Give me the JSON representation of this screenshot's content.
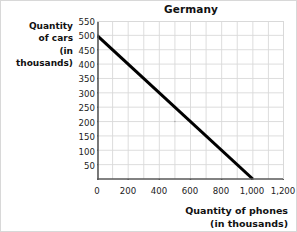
{
  "chart_data": {
    "type": "line",
    "title": "Germany",
    "xlabel_line1": "Quantity of phones",
    "xlabel_line2": "(in thousands)",
    "ylabel_line1": "Quantity",
    "ylabel_line2": "of cars",
    "ylabel_line3": "(in thousands)",
    "xlabel": "Quantity of phones (in thousands)",
    "ylabel": "Quantity of cars (in thousands)",
    "xlim": [
      0,
      1200
    ],
    "ylim": [
      0,
      550
    ],
    "xticks": [
      0,
      200,
      400,
      600,
      800,
      1000,
      1200
    ],
    "xticklabels": [
      "0",
      "200",
      "400",
      "600",
      "800",
      "1,000",
      "1,200"
    ],
    "yticks": [
      50,
      100,
      150,
      200,
      250,
      300,
      350,
      400,
      450,
      500,
      550
    ],
    "yticklabels": [
      "50",
      "100",
      "150",
      "200",
      "250",
      "300",
      "350",
      "400",
      "450",
      "500",
      "550"
    ],
    "grid": true,
    "grid_color": "#d9d9d9",
    "line_color": "#000000",
    "legend": "none",
    "series": [
      {
        "name": "production possibilities frontier",
        "x": [
          0,
          1000
        ],
        "y": [
          500,
          0
        ],
        "points": [
          [
            0,
            500
          ],
          [
            1000,
            0
          ]
        ]
      }
    ],
    "annotations": []
  }
}
